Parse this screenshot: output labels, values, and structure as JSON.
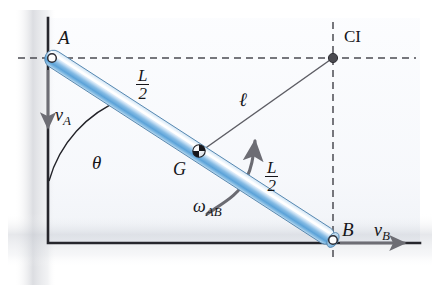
{
  "figure": {
    "background": "#ffffff",
    "rod_color_mid": "#2f78c4",
    "rod_color_edge": "#e8f2fb",
    "rod_highlight": "#ffffff",
    "line_color": "#16161a",
    "dash_color": "#4b4b52",
    "ci_dot_color": "#4a4a50",
    "arrow_color": "#5a5a60"
  },
  "labels": {
    "point_a": "A",
    "point_b": "B",
    "point_g": "G",
    "center_instantaneous": "CI",
    "velocity_a": "v",
    "velocity_a_sub": "A",
    "velocity_b": "v",
    "velocity_b_sub": "B",
    "angle_theta": "θ",
    "omega": "ω",
    "omega_sub": "AB",
    "length_half_num": "L",
    "length_half_den": "2",
    "ell": "ℓ"
  },
  "geometry": {
    "wall_x": 48,
    "ground_y": 243,
    "wall_top_y": 18,
    "ground_right_x": 420,
    "a_x": 52,
    "a_y": 58,
    "b_x": 333,
    "b_y": 240,
    "g_x": 193,
    "g_y": 149,
    "ci_x": 333,
    "ci_y": 58,
    "rod_radius": 8,
    "pin_radius": 4.2,
    "ci_dot_radius": 4.6
  },
  "annotations": {
    "ell_line": "line from G to CI",
    "dashed_horizontal": "from A to CI",
    "dashed_vertical": "from CI to B",
    "theta_arc": "angle between wall and rod at A",
    "omega_arc": "counterclockwise angular velocity arrow",
    "g_symbol": "quartered center-of-mass marker"
  }
}
